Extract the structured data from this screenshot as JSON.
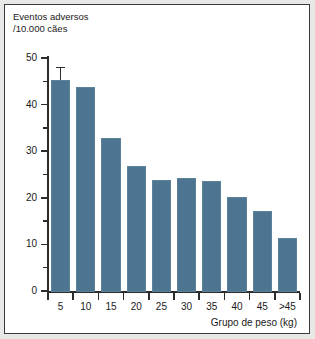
{
  "figure": {
    "background_color": "#e8e8e6",
    "frame_border_color": "#3a3a3a",
    "plot_background": "#ffffff"
  },
  "chart_data": {
    "type": "bar",
    "title": "",
    "subtitle": "",
    "ylabel_line1": "Eventos adversos",
    "ylabel_line2": "/10.000 cães",
    "xlabel": "Grupo de peso (kg)",
    "categories": [
      "5",
      "10",
      "15",
      "20",
      "25",
      "30",
      "35",
      "40",
      "45",
      ">45"
    ],
    "values": [
      45.5,
      44.0,
      33.0,
      27.0,
      24.0,
      24.5,
      23.8,
      20.3,
      17.3,
      11.5
    ],
    "errors": [
      2.5,
      null,
      null,
      null,
      null,
      null,
      null,
      null,
      null,
      null
    ],
    "ylim": [
      0,
      50
    ],
    "ytick_values": [
      0,
      10,
      20,
      30,
      40,
      50
    ],
    "ytick_labels": [
      "0",
      "10",
      "20",
      "30",
      "40",
      "50"
    ],
    "yminor_tick_values": [
      5,
      15,
      25,
      35,
      45
    ],
    "grid": false,
    "legend": null,
    "bar_color": "#4d7490",
    "bar_edge_color": "#5d8199",
    "axis_color": "#2c2c2c"
  }
}
